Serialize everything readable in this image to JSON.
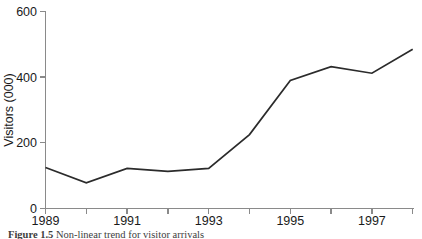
{
  "figure": {
    "caption_label": "Figure 1.5",
    "caption_text": "Non-linear trend for visitor arrivals"
  },
  "chart_data": {
    "type": "line",
    "title": "",
    "xlabel": "",
    "ylabel": "Visitors (000)",
    "x": [
      1989,
      1990,
      1991,
      1992,
      1993,
      1994,
      1995,
      1996,
      1997,
      1998
    ],
    "values": [
      125,
      78,
      122,
      113,
      122,
      225,
      390,
      432,
      412,
      485
    ],
    "series": [
      {
        "name": "Visitor arrivals",
        "values": [
          125,
          78,
          122,
          113,
          122,
          225,
          390,
          432,
          412,
          485
        ]
      }
    ],
    "ylim": [
      0,
      600
    ],
    "yticks": [
      0,
      200,
      400,
      600
    ],
    "ytick_labels": [
      "0",
      "200",
      "400",
      "600"
    ],
    "xlim": [
      1989,
      1998
    ],
    "xticks": [
      1989,
      1990,
      1991,
      1992,
      1993,
      1994,
      1995,
      1996,
      1997,
      1998
    ],
    "xtick_labels": [
      "1989",
      "",
      "1991",
      "",
      "1993",
      "",
      "1995",
      "",
      "1997",
      ""
    ],
    "xtick_labels_shown": [
      "1989",
      "1991",
      "1993",
      "1995",
      "1997"
    ],
    "grid": false,
    "legend": false,
    "line_color": "#2b2b2b",
    "axis_color": "#8a8a8a"
  }
}
